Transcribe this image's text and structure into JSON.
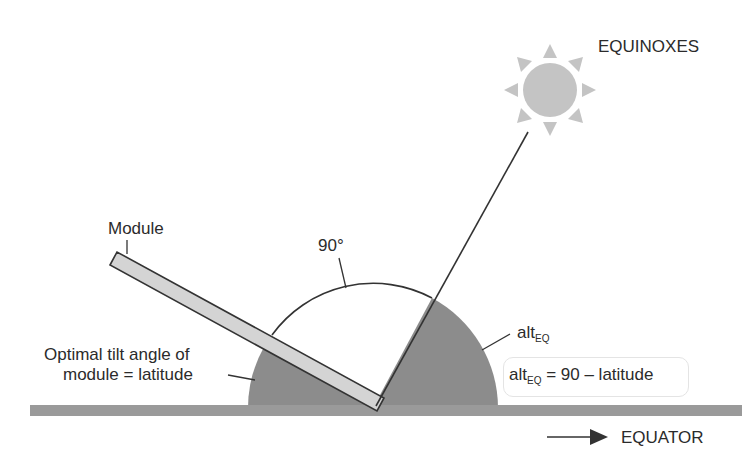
{
  "labels": {
    "equinoxes": "EQUINOXES",
    "module": "Module",
    "angle_90": "90°",
    "tilt_line1": "Optimal tilt angle of",
    "tilt_line2": "module = latitude",
    "alt_main": "alt",
    "alt_sub": "EQ",
    "formula_main": "alt",
    "formula_sub": "EQ",
    "formula_rest": " = 90 – latitude",
    "equator": "EQUATOR"
  },
  "colors": {
    "ground": "#9a9a9a",
    "shaded_sector": "#8c8c8c",
    "module_fill": "#d4d4d4",
    "sun": "#bdbdbd",
    "line": "#333333"
  }
}
